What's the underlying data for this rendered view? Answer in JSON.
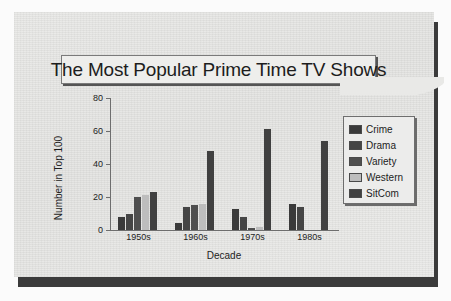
{
  "title": "The Most Popular Prime Time TV Shows",
  "legend": {
    "items": [
      {
        "label": "Crime",
        "color": "#3a3a3a"
      },
      {
        "label": "Drama",
        "color": "#454545"
      },
      {
        "label": "Variety",
        "color": "#4f4f4f"
      },
      {
        "label": "Western",
        "color": "#bdbdbd"
      },
      {
        "label": "SitCom",
        "color": "#404040"
      }
    ]
  },
  "axes": {
    "ylabel": "Number in Top 100",
    "xlabel": "Decade",
    "yticks": [
      0,
      20,
      40,
      60,
      80
    ]
  },
  "chart_data": {
    "type": "bar",
    "title": "The Most Popular Prime Time TV Shows",
    "xlabel": "Decade",
    "ylabel": "Number in Top 100",
    "ylim": [
      0,
      80
    ],
    "yticks": [
      0,
      20,
      40,
      60,
      80
    ],
    "grid": false,
    "legend_position": "right",
    "categories": [
      "1950s",
      "1960s",
      "1970s",
      "1980s"
    ],
    "series": [
      {
        "name": "Crime",
        "color": "#3a3a3a",
        "values": [
          8,
          4,
          13,
          16
        ]
      },
      {
        "name": "Drama",
        "color": "#454545",
        "values": [
          10,
          14,
          8,
          14
        ]
      },
      {
        "name": "Variety",
        "color": "#4f4f4f",
        "values": [
          20,
          15,
          1,
          0
        ]
      },
      {
        "name": "Western",
        "color": "#bdbdbd",
        "values": [
          21,
          16,
          2,
          0
        ]
      },
      {
        "name": "SitCom",
        "color": "#404040",
        "values": [
          23,
          48,
          61,
          54
        ]
      }
    ]
  }
}
